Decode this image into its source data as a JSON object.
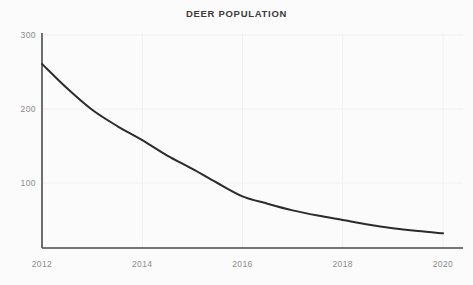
{
  "chart_data": {
    "type": "line",
    "title": "DEER POPULATION",
    "xlabel": "",
    "ylabel": "",
    "x": [
      2012,
      2012.5,
      2013,
      2013.5,
      2014,
      2014.5,
      2015,
      2015.5,
      2016,
      2016.5,
      2017,
      2017.5,
      2018,
      2018.5,
      2019,
      2019.5,
      2020
    ],
    "values": [
      261,
      228,
      199,
      177,
      158,
      137,
      119,
      100,
      82,
      72,
      63,
      56,
      50,
      44,
      39,
      35,
      32
    ],
    "series": [
      {
        "name": "Deer population",
        "values": [
          261,
          228,
          199,
          177,
          158,
          137,
          119,
          100,
          82,
          72,
          63,
          56,
          50,
          44,
          39,
          35,
          32
        ],
        "color": "#2b2b2b"
      }
    ],
    "x_ticks": [
      "2012",
      "2014",
      "2016",
      "2018",
      "2020"
    ],
    "x_tick_values": [
      2012,
      2014,
      2016,
      2018,
      2020
    ],
    "y_ticks": [
      "100",
      "200",
      "300"
    ],
    "y_tick_values": [
      100,
      200,
      300
    ],
    "xlim": [
      2012,
      2020
    ],
    "ylim": [
      0,
      300
    ],
    "grid": true,
    "grid_color": "#f0f0f0",
    "legend": "none",
    "axis_color": "#4a4a4a",
    "tick_label_color": "#8b8b8b",
    "title_color": "#3a3a3a",
    "background_color": "#fbfbfb",
    "line_color": "#2b2b2b",
    "line_width": 2
  }
}
